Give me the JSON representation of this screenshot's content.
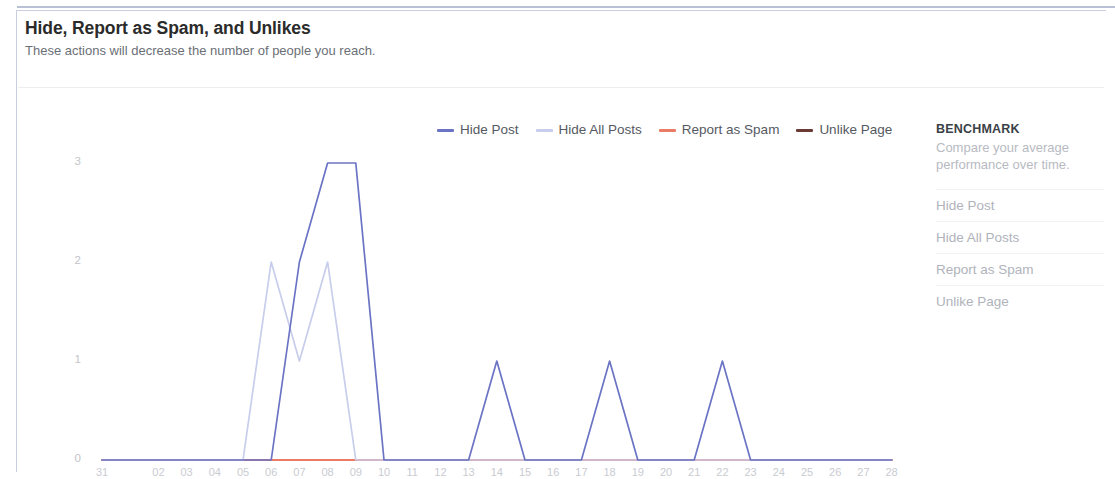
{
  "header": {
    "title": "Hide, Report as Spam, and Unlikes",
    "subtitle": "These actions will decrease the number of people you reach."
  },
  "legend": {
    "items": [
      {
        "label": "Hide Post",
        "color": "#6b74c4"
      },
      {
        "label": "Hide All Posts",
        "color": "#c7cdeb"
      },
      {
        "label": "Report as Spam",
        "color": "#ea7b64"
      },
      {
        "label": "Unlike Page",
        "color": "#6b3a34"
      }
    ]
  },
  "benchmark": {
    "title": "BENCHMARK",
    "description": "Compare your average performance over time.",
    "items": [
      "Hide Post",
      "Hide All Posts",
      "Report as Spam",
      "Unlike Page"
    ]
  },
  "axis": {
    "month_label": "JAN",
    "y_ticks": [
      "3",
      "2",
      "1",
      "0"
    ],
    "x_ticks": [
      "31",
      "01",
      "02",
      "03",
      "04",
      "05",
      "06",
      "07",
      "08",
      "09",
      "10",
      "11",
      "12",
      "13",
      "14",
      "15",
      "16",
      "17",
      "18",
      "19",
      "20",
      "21",
      "22",
      "23",
      "24",
      "25",
      "26",
      "27",
      "28"
    ]
  },
  "chart_data": {
    "type": "line",
    "title": "Hide, Report as Spam, and Unlikes",
    "subtitle": "These actions will decrease the number of people you reach.",
    "xlabel": "",
    "ylabel": "",
    "ylim": [
      0,
      3
    ],
    "y_ticks": [
      0,
      1,
      2,
      3
    ],
    "grid": false,
    "legend_position": "top-center",
    "x": [
      "31",
      "01",
      "02",
      "03",
      "04",
      "05",
      "06",
      "07",
      "08",
      "09",
      "10",
      "11",
      "12",
      "13",
      "14",
      "15",
      "16",
      "17",
      "18",
      "19",
      "20",
      "21",
      "22",
      "23",
      "24",
      "25",
      "26",
      "27",
      "28"
    ],
    "series": [
      {
        "name": "Hide Post",
        "color": "#6b74c4",
        "values": [
          0,
          0,
          0,
          0,
          0,
          0,
          0,
          2,
          3,
          3,
          0,
          0,
          0,
          0,
          1,
          0,
          0,
          0,
          1,
          0,
          0,
          0,
          1,
          0,
          0,
          0,
          0,
          0,
          0
        ]
      },
      {
        "name": "Hide All Posts",
        "color": "#c7cdeb",
        "values": [
          0,
          0,
          0,
          0,
          0,
          0,
          2,
          1,
          2,
          0,
          0,
          0,
          0,
          0,
          0,
          0,
          0,
          0,
          0,
          0,
          0,
          0,
          0,
          0,
          0,
          0,
          0,
          0,
          0
        ]
      },
      {
        "name": "Report as Spam",
        "color": "#ea7b64",
        "values": [
          0,
          0,
          0,
          0,
          0,
          0,
          0,
          0,
          0,
          0,
          0,
          0,
          0,
          0,
          0,
          0,
          0,
          0,
          0,
          0,
          0,
          0,
          0,
          0,
          0,
          0,
          0,
          0,
          0
        ]
      },
      {
        "name": "Unlike Page",
        "color": "#6b3a34",
        "values": [
          0,
          0,
          0,
          0,
          0,
          0,
          0,
          0,
          0,
          0,
          0,
          0,
          0,
          0,
          0,
          0,
          0,
          0,
          0,
          0,
          0,
          0,
          0,
          0,
          0,
          0,
          0,
          0,
          0
        ]
      }
    ]
  }
}
